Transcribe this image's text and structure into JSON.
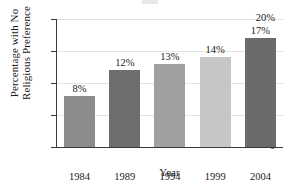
{
  "chart_data": {
    "type": "bar",
    "title": "",
    "xlabel": "Year",
    "ylabel": "Percentage with No Religious Preference",
    "ylabel_line1": "Percentage with No",
    "ylabel_line2": "Religious Preference",
    "categories": [
      "1984",
      "1989",
      "1994",
      "1999",
      "2004"
    ],
    "values": [
      8,
      12,
      13,
      14,
      17
    ],
    "value_labels": [
      "8%",
      "12%",
      "13%",
      "14%",
      "17%"
    ],
    "ylim": [
      0,
      20
    ],
    "yticks": [
      0,
      5,
      10,
      15,
      20
    ],
    "ytick_labels": [
      "0",
      "5%",
      "10%",
      "15%",
      "20%"
    ],
    "grid": true,
    "legend": "none",
    "bar_colors": [
      "#8c8c8c",
      "#6e6e6e",
      "#a0a0a0",
      "#c6c6c6",
      "#6b6b6b"
    ],
    "axis_color": "#3a3a3a",
    "grid_color": "#e3e3e3",
    "background": "#ffffff"
  }
}
